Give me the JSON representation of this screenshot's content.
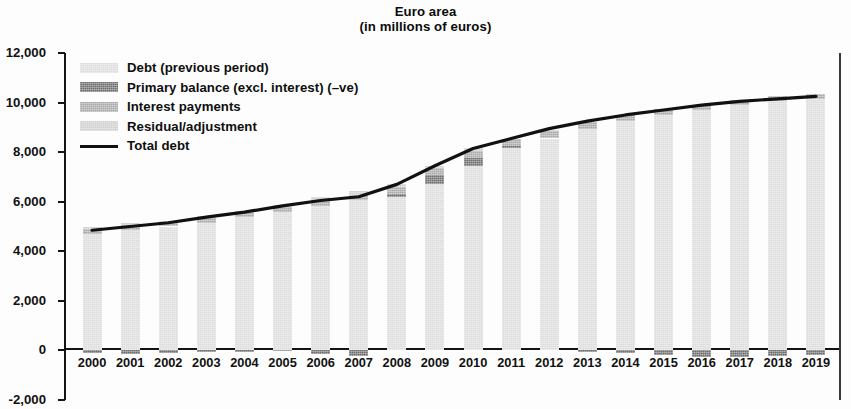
{
  "title": {
    "line1": "Euro area",
    "line2": "(in millions of euros)"
  },
  "legend": {
    "items": [
      {
        "label": "Debt (previous period)",
        "color": "#dcdcdc",
        "kind": "swatch"
      },
      {
        "label": "Primary balance (excl. interest) (–ve)",
        "color": "#6e6e6e",
        "kind": "swatch"
      },
      {
        "label": "Interest payments",
        "color": "#a9a9a9",
        "kind": "swatch"
      },
      {
        "label": "Residual/adjustment",
        "color": "#cfcfcf",
        "kind": "swatch"
      },
      {
        "label": "Total debt",
        "color": "#111111",
        "kind": "line"
      }
    ]
  },
  "chart_data": {
    "type": "bar",
    "stacked": true,
    "title": "Euro area\n(in millions of euros)",
    "xlabel": "",
    "ylabel": "",
    "ylim": [
      -2000,
      12000
    ],
    "ytick_step": 2000,
    "ytick_labels": [
      "12,000",
      "10,000",
      "8,000",
      "6,000",
      "4,000",
      "2,000",
      "0",
      "-2,000"
    ],
    "ytick_values": [
      12000,
      10000,
      8000,
      6000,
      4000,
      2000,
      0,
      -2000
    ],
    "grid": false,
    "legend_position": "upper-left-inside",
    "categories": [
      "2000",
      "2001",
      "2002",
      "2003",
      "2004",
      "2005",
      "2006",
      "2007",
      "2008",
      "2009",
      "2010",
      "2011",
      "2012",
      "2013",
      "2014",
      "2015",
      "2016",
      "2017",
      "2018",
      "2019"
    ],
    "series": [
      {
        "name": "Debt (previous period)",
        "color": "#dcdcdc",
        "values": [
          4700,
          4850,
          5000,
          5150,
          5380,
          5580,
          5830,
          6050,
          6200,
          6700,
          7450,
          8150,
          8550,
          8950,
          9250,
          9500,
          9700,
          9900,
          10050,
          10150
        ]
      },
      {
        "name": "Primary balance (excl. interest) (–ve)",
        "color": "#6e6e6e",
        "values": [
          -120,
          -150,
          -90,
          -60,
          -50,
          -40,
          -140,
          -230,
          120,
          380,
          330,
          80,
          -20,
          -60,
          -120,
          -200,
          -250,
          -250,
          -230,
          -200
        ]
      },
      {
        "name": "Interest payments",
        "color": "#a9a9a9",
        "values": [
          200,
          210,
          200,
          200,
          200,
          210,
          220,
          240,
          270,
          280,
          280,
          300,
          300,
          280,
          260,
          240,
          220,
          210,
          200,
          190
        ]
      },
      {
        "name": "Residual/adjustment",
        "color": "#cfcfcf",
        "values": [
          70,
          90,
          40,
          90,
          50,
          80,
          140,
          140,
          110,
          90,
          90,
          20,
          40,
          20,
          10,
          0,
          0,
          0,
          0,
          0
        ]
      },
      {
        "name": "Total debt",
        "color": "#111111",
        "type": "line",
        "values": [
          4850,
          5000,
          5150,
          5380,
          5580,
          5830,
          6050,
          6200,
          6700,
          7450,
          8150,
          8550,
          8950,
          9250,
          9500,
          9700,
          9900,
          10050,
          10150,
          10250
        ]
      }
    ]
  }
}
